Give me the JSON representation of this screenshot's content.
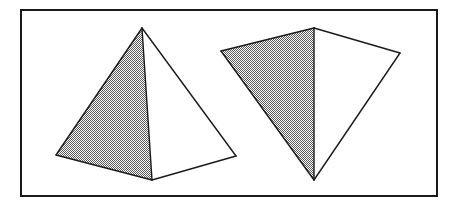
{
  "figure": {
    "canvas": {
      "width": 456,
      "height": 207,
      "background": "#ffffff"
    },
    "border": {
      "label": "figure-border",
      "x": 21,
      "y": 10,
      "width": 416,
      "height": 186,
      "stroke": "#1a1a1a",
      "stroke_width": 2,
      "fill": "none"
    },
    "style": {
      "line_color": "#1a1a1a",
      "line_width": 1.4,
      "shade_fill": "#b8b8b8",
      "plain_fill": "#ffffff",
      "shade_pattern": "checkerboard-dither-50",
      "pattern_dot_color": "#5a5a5a",
      "pattern_cell_px": 2
    },
    "shapes": [
      {
        "name": "left-pyramid",
        "label": "Left square pyramid, near-frontal view",
        "vertices": {
          "apex": [
            142,
            28
          ],
          "front_left_base": [
            56,
            155
          ],
          "front_center_base": [
            152,
            180
          ],
          "front_right_base": [
            236,
            156
          ]
        },
        "faces": [
          {
            "name": "left-face-shaded",
            "fill": "shade",
            "points": "142,28 56,155 152,180"
          },
          {
            "name": "right-face-plain",
            "fill": "plain",
            "points": "142,28 152,180 236,156"
          }
        ],
        "edges": [
          {
            "name": "apex-to-left-base",
            "from": [
              142,
              28
            ],
            "to": [
              56,
              155
            ]
          },
          {
            "name": "apex-to-center-base",
            "from": [
              142,
              28
            ],
            "to": [
              152,
              180
            ]
          },
          {
            "name": "apex-to-right-base",
            "from": [
              142,
              28
            ],
            "to": [
              236,
              156
            ]
          },
          {
            "name": "left-base-to-center-base",
            "from": [
              56,
              155
            ],
            "to": [
              152,
              180
            ]
          },
          {
            "name": "center-base-to-right-base",
            "from": [
              152,
              180
            ],
            "to": [
              236,
              156
            ]
          }
        ]
      },
      {
        "name": "right-pyramid",
        "label": "Right square pyramid, tilted / rotated view",
        "vertices": {
          "top_apex": [
            314,
            28
          ],
          "left_base": [
            221,
            51
          ],
          "bottom_base": [
            314,
            180
          ],
          "right_base": [
            400,
            53
          ]
        },
        "faces": [
          {
            "name": "left-face-shaded",
            "fill": "shade",
            "points": "314,28 221,51 314,180"
          },
          {
            "name": "right-face-plain",
            "fill": "plain",
            "points": "314,28 314,180 400,53"
          }
        ],
        "edges": [
          {
            "name": "apex-to-left-base",
            "from": [
              314,
              28
            ],
            "to": [
              221,
              51
            ]
          },
          {
            "name": "apex-to-bottom-base",
            "from": [
              314,
              28
            ],
            "to": [
              314,
              180
            ]
          },
          {
            "name": "apex-to-right-base",
            "from": [
              314,
              28
            ],
            "to": [
              400,
              53
            ]
          },
          {
            "name": "left-base-to-bottom-base",
            "from": [
              221,
              51
            ],
            "to": [
              314,
              180
            ]
          },
          {
            "name": "bottom-base-to-right-base",
            "from": [
              314,
              180
            ],
            "to": [
              400,
              53
            ]
          }
        ]
      }
    ]
  }
}
